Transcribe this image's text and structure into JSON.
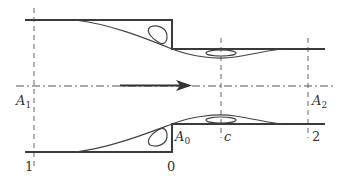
{
  "figure": {
    "colors": {
      "wall": "#3a3a3a",
      "streamline": "#444444",
      "centerline": "#555555",
      "section_line": "#666666",
      "arrow": "#333333"
    },
    "labels": {
      "A1": {
        "main": "A",
        "sub": "1"
      },
      "A2": {
        "main": "A",
        "sub": "2"
      },
      "A0": {
        "main": "A",
        "sub": "0"
      },
      "c": "c",
      "section_1": "1",
      "section_0": "0",
      "section_2": "2"
    },
    "sections": [
      {
        "id": "1",
        "x": 34
      },
      {
        "id": "0",
        "x": 172
      },
      {
        "id": "c",
        "x": 221
      },
      {
        "id": "2",
        "x": 308
      }
    ],
    "flow_direction": "right"
  }
}
